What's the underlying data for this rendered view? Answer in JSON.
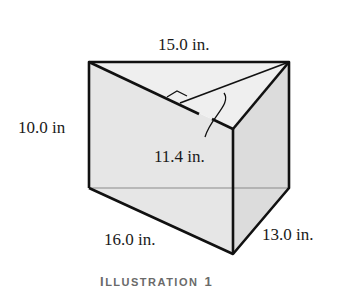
{
  "figure": {
    "type": "triangular-prism",
    "caption_first": "I",
    "caption_rest": "LLUSTRATION",
    "caption_number": "1",
    "labels": {
      "top_edge": "15.0 in.",
      "height_edge": "10.0 in",
      "altitude": "11.4 in.",
      "bottom_left_edge": "16.0 in.",
      "bottom_right_edge": "13.0 in."
    },
    "colors": {
      "face_front": "#e6e6e6",
      "face_right": "#dcdcdc",
      "top": "#ececec",
      "edge": "#111111",
      "hidden_edge": "#888888"
    }
  }
}
